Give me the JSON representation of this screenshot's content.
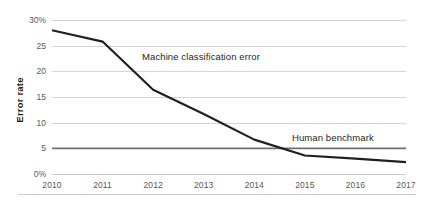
{
  "chart_data": {
    "type": "line",
    "title": "",
    "subtitle": "",
    "xlabel": "",
    "ylabel": "Error rate",
    "x": [
      2010,
      2011,
      2012,
      2013,
      2014,
      2015,
      2016,
      2017
    ],
    "categories": [
      "2010",
      "2011",
      "2012",
      "2013",
      "2014",
      "2015",
      "2016",
      "2017"
    ],
    "series": [
      {
        "name": "Machine classification error",
        "values": [
          28.0,
          25.8,
          16.4,
          11.7,
          6.7,
          3.6,
          3.0,
          2.3
        ],
        "color": "#231f20",
        "line_width": 2.2
      },
      {
        "name": "Human benchmark",
        "values": [
          5.0,
          5.0,
          5.0,
          5.0,
          5.0,
          5.0,
          5.0,
          5.0
        ],
        "color": "#6d6e71",
        "line_width": 1.6
      }
    ],
    "ylim": [
      0,
      30
    ],
    "xlim": [
      2010,
      2017
    ],
    "yticks": [
      0,
      5,
      10,
      15,
      20,
      25,
      30
    ],
    "ytick_labels": [
      "0%",
      "5",
      "10",
      "15",
      "20",
      "25",
      "30%"
    ],
    "xtick_labels": [
      "2010",
      "2011",
      "2012",
      "2013",
      "2014",
      "2015",
      "2016",
      "2017"
    ],
    "grid": true,
    "grid_axis": "y",
    "grid_color": "#d4d4d6",
    "legend_position": "inline-annotations",
    "annotations": [
      {
        "text": "Machine classification error",
        "series": "Machine classification error"
      },
      {
        "text": "Human benchmark",
        "series": "Human benchmark"
      }
    ],
    "background_color": "#ffffff"
  },
  "axes": {
    "y_title": "Error rate",
    "y_ticks": [
      {
        "label": "30%",
        "value": 30
      },
      {
        "label": "25",
        "value": 25
      },
      {
        "label": "20",
        "value": 20
      },
      {
        "label": "15",
        "value": 15
      },
      {
        "label": "10",
        "value": 10
      },
      {
        "label": "5",
        "value": 5
      },
      {
        "label": "0%",
        "value": 0
      }
    ],
    "x_ticks": [
      {
        "label": "2010",
        "value": 2010
      },
      {
        "label": "2011",
        "value": 2011
      },
      {
        "label": "2012",
        "value": 2012
      },
      {
        "label": "2013",
        "value": 2013
      },
      {
        "label": "2014",
        "value": 2014
      },
      {
        "label": "2015",
        "value": 2015
      },
      {
        "label": "2016",
        "value": 2016
      },
      {
        "label": "2017",
        "value": 2017
      }
    ]
  },
  "annotations": {
    "machine_label": "Machine classification error",
    "human_label": "Human benchmark"
  }
}
